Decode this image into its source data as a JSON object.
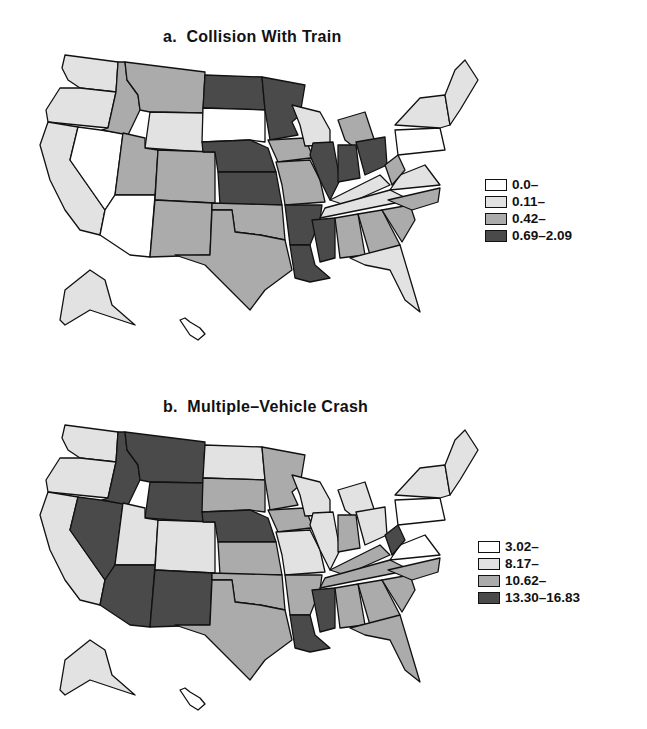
{
  "colors": {
    "c0": "#ffffff",
    "c1": "#e2e2e2",
    "c2": "#ababab",
    "c3": "#4a4a4a"
  },
  "panel_a": {
    "title": "a.  Collision With Train",
    "legend": [
      {
        "label": "0.0–",
        "class": "c0"
      },
      {
        "label": "0.11–",
        "class": "c1"
      },
      {
        "label": "0.42–",
        "class": "c2"
      },
      {
        "label": "0.69–2.09",
        "class": "c3"
      }
    ],
    "states": {
      "WA": "c1",
      "OR": "c1",
      "CA": "c1",
      "NV": "c0",
      "ID": "c2",
      "MT": "c2",
      "WY": "c1",
      "UT": "c2",
      "AZ": "c0",
      "CO": "c2",
      "NM": "c2",
      "ND": "c3",
      "SD": "c0",
      "NE": "c3",
      "KS": "c3",
      "OK": "c2",
      "TX": "c2",
      "MN": "c3",
      "IA": "c2",
      "MO": "c2",
      "AR": "c3",
      "LA": "c3",
      "WI": "c1",
      "IL": "c3",
      "MI": "c2",
      "IN": "c3",
      "OH": "c3",
      "KY": "c1",
      "TN": "c1",
      "MS": "c3",
      "AL": "c2",
      "GA": "c2",
      "FL": "c1",
      "SC": "c2",
      "NC": "c2",
      "VA": "c1",
      "WV": "c2",
      "PA": "c0",
      "NY": "c1",
      "NE_reg": "c1",
      "AK": "c1",
      "HI": "c0"
    }
  },
  "panel_b": {
    "title": "b.  Multiple–Vehicle Crash",
    "legend": [
      {
        "label": "3.02–",
        "class": "c0"
      },
      {
        "label": "8.17–",
        "class": "c1"
      },
      {
        "label": "10.62–",
        "class": "c2"
      },
      {
        "label": "13.30–16.83",
        "class": "c3"
      }
    ],
    "states": {
      "WA": "c1",
      "OR": "c1",
      "CA": "c1",
      "NV": "c3",
      "ID": "c3",
      "MT": "c3",
      "WY": "c3",
      "UT": "c1",
      "AZ": "c3",
      "CO": "c1",
      "NM": "c3",
      "ND": "c1",
      "SD": "c2",
      "NE": "c3",
      "KS": "c2",
      "OK": "c2",
      "TX": "c2",
      "MN": "c2",
      "IA": "c2",
      "MO": "c1",
      "AR": "c2",
      "LA": "c3",
      "WI": "c1",
      "IL": "c1",
      "MI": "c1",
      "IN": "c2",
      "OH": "c1",
      "KY": "c2",
      "TN": "c2",
      "MS": "c3",
      "AL": "c2",
      "GA": "c2",
      "FL": "c2",
      "SC": "c2",
      "NC": "c2",
      "VA": "c0",
      "WV": "c3",
      "PA": "c0",
      "NY": "c1",
      "NE_reg": "c1",
      "AK": "c1",
      "HI": "c0"
    }
  }
}
